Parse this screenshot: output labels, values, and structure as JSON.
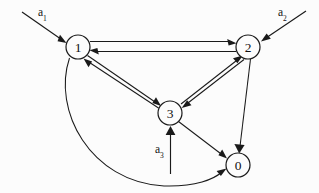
{
  "diagram": {
    "background_color": "#fcfcfc",
    "stroke_color": "#1a1a1a",
    "nodes": [
      {
        "id": "1",
        "label": "1",
        "cx": 78,
        "cy": 47,
        "r": 12
      },
      {
        "id": "2",
        "label": "2",
        "cx": 248,
        "cy": 47,
        "r": 12
      },
      {
        "id": "3",
        "label": "3",
        "cx": 170,
        "cy": 113,
        "r": 12
      },
      {
        "id": "0",
        "label": "0",
        "cx": 238,
        "cy": 165,
        "r": 12
      }
    ],
    "inputs": [
      {
        "id": "a1",
        "label": "a",
        "subscript": "1",
        "target": "1",
        "label_x": 38,
        "label_y": 16
      },
      {
        "id": "a2",
        "label": "a",
        "subscript": "2",
        "target": "2",
        "label_x": 278,
        "label_y": 16
      },
      {
        "id": "a3",
        "label": "a",
        "subscript": "3",
        "target": "3",
        "label_x": 155,
        "label_y": 153
      }
    ],
    "edges": [
      {
        "id": "e-1-2",
        "from": "1",
        "to": "2",
        "style": "straight"
      },
      {
        "id": "e-2-1",
        "from": "2",
        "to": "1",
        "style": "straight"
      },
      {
        "id": "e-1-3",
        "from": "1",
        "to": "3",
        "style": "straight"
      },
      {
        "id": "e-3-1",
        "from": "3",
        "to": "1",
        "style": "straight"
      },
      {
        "id": "e-3-2",
        "from": "3",
        "to": "2",
        "style": "straight"
      },
      {
        "id": "e-2-3",
        "from": "2",
        "to": "3",
        "style": "straight"
      },
      {
        "id": "e-2-0",
        "from": "2",
        "to": "0",
        "style": "straight"
      },
      {
        "id": "e-3-0",
        "from": "3",
        "to": "0",
        "style": "straight"
      },
      {
        "id": "e-1-0",
        "from": "1",
        "to": "0",
        "style": "curved"
      }
    ]
  }
}
